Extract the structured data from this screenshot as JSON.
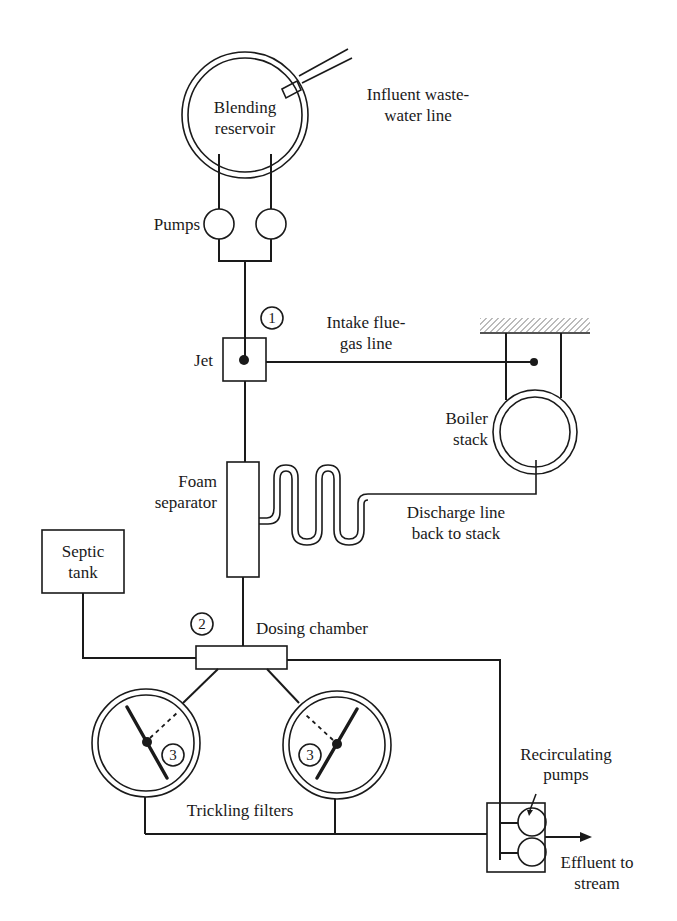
{
  "diagram": {
    "title": "",
    "components": {
      "blending_reservoir": {
        "label_line1": "Blending",
        "label_line2": "reservoir"
      },
      "influent_line": {
        "label_line1": "Influent waste-",
        "label_line2": "water line"
      },
      "pumps": {
        "label": "Pumps"
      },
      "jet": {
        "label": "Jet",
        "marker": "1"
      },
      "flue_gas_line": {
        "label_line1": "Intake flue-",
        "label_line2": "gas line"
      },
      "boiler_stack": {
        "label_line1": "Boiler",
        "label_line2": "stack"
      },
      "foam_separator": {
        "label_line1": "Foam",
        "label_line2": "separator"
      },
      "discharge_line": {
        "label_line1": "Discharge line",
        "label_line2": "back to stack"
      },
      "septic_tank": {
        "label_line1": "Septic",
        "label_line2": "tank"
      },
      "dosing_chamber": {
        "label": "Dosing chamber",
        "marker": "2"
      },
      "trickling_filters": {
        "label": "Trickling filters",
        "marker_left": "3",
        "marker_right": "3"
      },
      "recirculating_pumps": {
        "label_line1": "Recirculating",
        "label_line2": "pumps"
      },
      "effluent": {
        "label_line1": "Effluent to",
        "label_line2": "stream"
      }
    },
    "colors": {
      "ink": "#1a1a1a",
      "background": "#ffffff"
    }
  }
}
